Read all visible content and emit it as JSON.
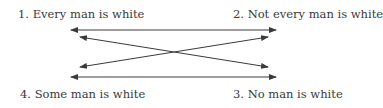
{
  "diagram": {
    "nodes": [
      {
        "id": 1,
        "label": "1.  Every man is white",
        "position": "top-left"
      },
      {
        "id": 2,
        "label": "2.  Not every man is white",
        "position": "top-right"
      },
      {
        "id": 3,
        "label": "3.  No man is white",
        "position": "bottom-right"
      },
      {
        "id": 4,
        "label": "4.  Some man is white",
        "position": "bottom-left"
      }
    ],
    "edges": [
      {
        "from": 1,
        "to": 2,
        "type": "bidirectional",
        "kind": "horizontal-top"
      },
      {
        "from": 4,
        "to": 3,
        "type": "bidirectional",
        "kind": "horizontal-bottom"
      },
      {
        "from": 1,
        "to": 3,
        "type": "bidirectional",
        "kind": "diagonal"
      },
      {
        "from": 2,
        "to": 4,
        "type": "bidirectional",
        "kind": "diagonal"
      }
    ],
    "colors": {
      "line": "#3a3a3a",
      "text": "#3a3a3a",
      "background": "#ffffff"
    }
  }
}
